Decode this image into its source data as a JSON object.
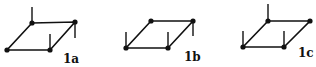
{
  "diagram": {
    "title": "",
    "colors": {
      "stroke": "#111111",
      "background": "#ffffff"
    },
    "figures": [
      {
        "id": "1a",
        "label": "1a",
        "label_pos": [
          63,
          55
        ],
        "vertices": {
          "bl": [
            7,
            50
          ],
          "br": [
            50,
            50
          ],
          "tl": [
            32,
            23
          ],
          "tr": [
            75,
            22
          ]
        },
        "stubs": [
          {
            "from": "tl",
            "dir": "up",
            "to": [
              32,
              7
            ]
          },
          {
            "from": "br",
            "dir": "up",
            "to": [
              50,
              34
            ]
          },
          {
            "from": "tr",
            "dir": "down",
            "to": [
              75,
              38
            ]
          }
        ]
      },
      {
        "id": "1b",
        "label": "1b",
        "label_pos": [
          186,
          53
        ],
        "vertices": {
          "bl": [
            126,
            48
          ],
          "br": [
            168,
            48
          ],
          "tl": [
            151,
            21
          ],
          "tr": [
            193,
            21
          ]
        },
        "stubs": [
          {
            "from": "bl",
            "dir": "up",
            "to": [
              126,
              32
            ]
          },
          {
            "from": "br",
            "dir": "up",
            "to": [
              168,
              32
            ]
          },
          {
            "from": "tr",
            "dir": "down",
            "to": [
              193,
              36
            ]
          }
        ]
      },
      {
        "id": "1c",
        "label": "1c",
        "label_pos": [
          302,
          49
        ],
        "vertices": {
          "bl": [
            243,
            47
          ],
          "br": [
            284,
            47
          ],
          "tl": [
            268,
            21
          ],
          "tr": [
            310,
            21
          ]
        },
        "stubs": [
          {
            "from": "tl",
            "dir": "up",
            "to": [
              268,
              4
            ]
          },
          {
            "from": "bl",
            "dir": "up",
            "to": [
              243,
              31
            ]
          },
          {
            "from": "br",
            "dir": "up",
            "to": [
              284,
              31
            ]
          }
        ]
      }
    ]
  }
}
